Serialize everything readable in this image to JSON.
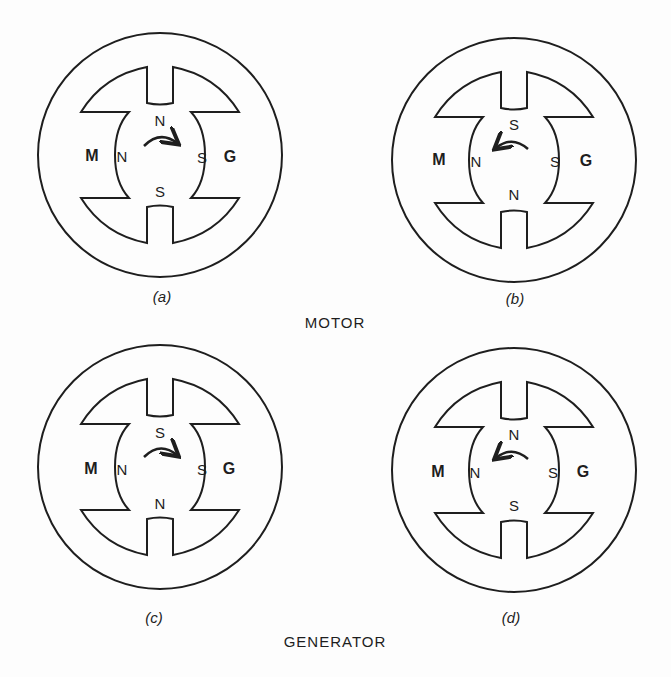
{
  "panels": [
    {
      "id": "a",
      "caption": "(a)",
      "cx": 160,
      "cy": 155,
      "top_pole": "N",
      "bottom_pole": "S",
      "left_pole": "N",
      "right_pole": "S",
      "left_label": "M",
      "right_label": "G",
      "rotation": "clockwise"
    },
    {
      "id": "b",
      "caption": "(b)",
      "cx": 514,
      "cy": 160,
      "top_pole": "S",
      "bottom_pole": "N",
      "left_pole": "N",
      "right_pole": "S",
      "left_label": "M",
      "right_label": "G",
      "rotation": "counterclockwise"
    },
    {
      "id": "c",
      "caption": "(c)",
      "cx": 160,
      "cy": 467,
      "top_pole": "S",
      "bottom_pole": "N",
      "left_pole": "N",
      "right_pole": "S",
      "left_label": "M",
      "right_label": "G",
      "rotation": "clockwise"
    },
    {
      "id": "d",
      "caption": "(d)",
      "cx": 514,
      "cy": 470,
      "top_pole": "N",
      "bottom_pole": "S",
      "left_pole": "N",
      "right_pole": "S",
      "left_label": "M",
      "right_label": "G",
      "rotation": "counterclockwise"
    }
  ],
  "section_titles": {
    "motor": "MOTOR",
    "generator": "GENERATOR"
  },
  "stroke_color": "#1e1e1e"
}
